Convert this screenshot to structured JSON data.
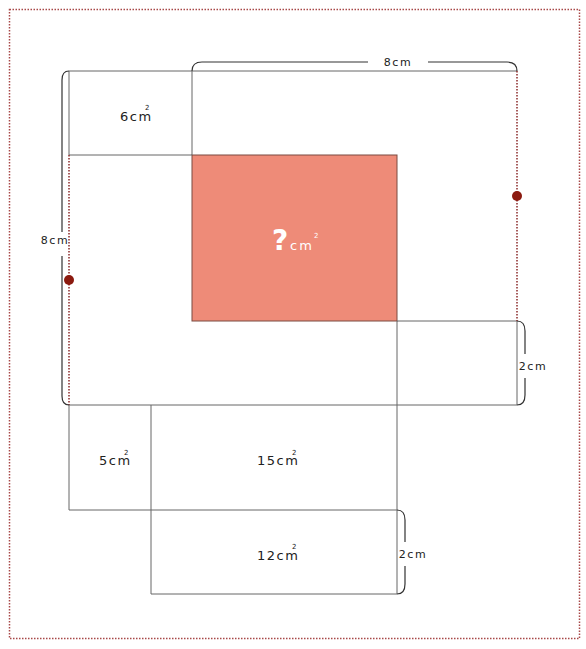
{
  "diagram": {
    "colors": {
      "line": "#555555",
      "bracket": "#333333",
      "dotted": "#8b2a2a",
      "frame": "#a84848",
      "highlight": "#ee8b78",
      "dot": "#8b1a0f",
      "unknown_text": "#ffffff"
    },
    "regions": [
      {
        "id": "top-left",
        "value": "6",
        "unit": "cm",
        "exp": "2"
      },
      {
        "id": "center",
        "value": "?",
        "unit": "cm",
        "exp": "2"
      },
      {
        "id": "bottom-left",
        "value": "5",
        "unit": "cm",
        "exp": "2"
      },
      {
        "id": "bottom-mid",
        "value": "15",
        "unit": "cm",
        "exp": "2"
      },
      {
        "id": "bottom",
        "value": "12",
        "unit": "cm",
        "exp": "2"
      }
    ],
    "dimensions": {
      "top": "8cm",
      "left": "8cm",
      "right": "2cm",
      "bottom_right": "2cm"
    }
  }
}
